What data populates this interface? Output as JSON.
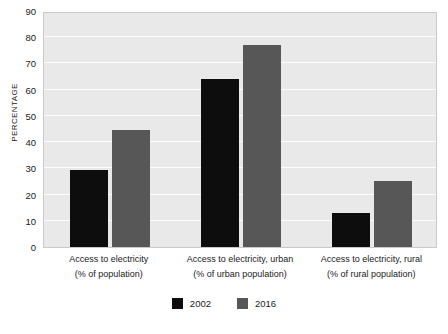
{
  "chart_data": {
    "type": "bar",
    "title": "",
    "subtitle": "",
    "xlabel": "",
    "ylabel": "PERCENTAGE",
    "ylim": [
      0,
      90
    ],
    "ytick_step": 10,
    "yticks": [
      90,
      80,
      70,
      60,
      50,
      40,
      30,
      20,
      10,
      0
    ],
    "grid": true,
    "legend_position": "bottom-center",
    "categories": [
      "Access to electricity\n(% of population)",
      "Access to electricity, urban\n(% of urban population)",
      "Access to electricity, rural\n(% of rural population)"
    ],
    "category_lines": [
      {
        "line1": "Access to electricity",
        "line2": "(% of population)"
      },
      {
        "line1": "Access to electricity, urban",
        "line2": "(% of urban population)"
      },
      {
        "line1": "Access to electricity, rural",
        "line2": "(% of rural population)"
      }
    ],
    "series": [
      {
        "name": "2002",
        "color": "#0d0d0d",
        "values": [
          29.5,
          64,
          13
        ]
      },
      {
        "name": "2016",
        "color": "#575757",
        "values": [
          44.5,
          77,
          25
        ]
      }
    ]
  },
  "legend": {
    "items": [
      {
        "label": "2002",
        "color": "#0d0d0d"
      },
      {
        "label": "2016",
        "color": "#575757"
      }
    ]
  },
  "colors": {
    "plot_background": "#e9e9e9",
    "gridline": "#fdfdfd",
    "plot_border": "#c9c9c9",
    "page_background": "#ffffff",
    "text": "#1a1a1a"
  }
}
